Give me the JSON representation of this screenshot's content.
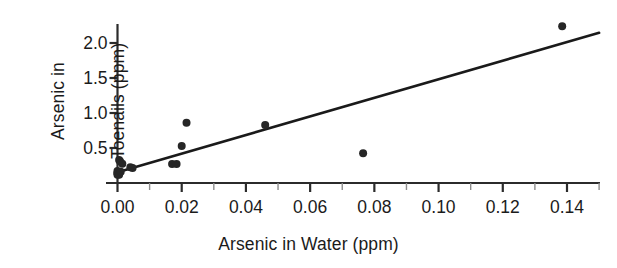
{
  "chart_data": {
    "type": "scatter",
    "title": "",
    "xlabel": "Arsenic in Water (ppm)",
    "ylabel_lines": [
      "Arsenic in",
      "Toenails (ppm)"
    ],
    "ylabel": "Arsenic in Toenails (ppm)",
    "xlim": [
      0.0,
      0.15
    ],
    "ylim": [
      0.0,
      2.35
    ],
    "xticks": [
      0.0,
      0.02,
      0.04,
      0.06,
      0.08,
      0.1,
      0.12,
      0.14
    ],
    "xtick_labels": [
      "0.00",
      "0.02",
      "0.04",
      "0.06",
      "0.08",
      "0.10",
      "0.12",
      "0.14"
    ],
    "xminor_ticks": [
      0.01,
      0.03,
      0.05,
      0.07,
      0.09,
      0.11,
      0.13,
      0.15
    ],
    "yticks": [
      0.5,
      1.0,
      1.5,
      2.0
    ],
    "ytick_labels": [
      "0.5",
      "1.0",
      "1.5",
      "2.0"
    ],
    "grid": false,
    "legend": false,
    "marker_color": "#262626",
    "line_color": "#1a1a1a",
    "axis_color": "#2b2b2b",
    "points": [
      {
        "x": 0.0,
        "y": 0.119
      },
      {
        "x": 0.0,
        "y": 0.135
      },
      {
        "x": 0.0,
        "y": 0.145
      },
      {
        "x": 0.0,
        "y": 0.17
      },
      {
        "x": 0.0005,
        "y": 0.118
      },
      {
        "x": 0.0005,
        "y": 0.33
      },
      {
        "x": 0.0008,
        "y": 0.31
      },
      {
        "x": 0.001,
        "y": 0.16
      },
      {
        "x": 0.0015,
        "y": 0.275
      },
      {
        "x": 0.004,
        "y": 0.225
      },
      {
        "x": 0.0047,
        "y": 0.215
      },
      {
        "x": 0.017,
        "y": 0.27
      },
      {
        "x": 0.0184,
        "y": 0.27
      },
      {
        "x": 0.02,
        "y": 0.53
      },
      {
        "x": 0.0215,
        "y": 0.86
      },
      {
        "x": 0.046,
        "y": 0.83
      },
      {
        "x": 0.0765,
        "y": 0.425
      },
      {
        "x": 0.1385,
        "y": 2.24
      }
    ],
    "fit_line": {
      "type": "linear-regression",
      "x_start": 0.0,
      "y_start": 0.155,
      "x_end": 0.15,
      "y_end": 2.145
    }
  }
}
